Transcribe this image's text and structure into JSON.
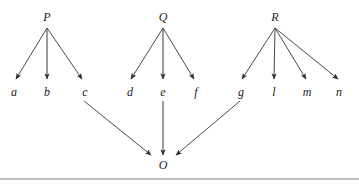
{
  "diagram": {
    "type": "directed-graph",
    "title": "",
    "style": {
      "background": "#ffffff",
      "node_text_color": "#1a1a1a",
      "edge_color": "#4a4a4a",
      "rule_color": "#808080"
    },
    "nodes": [
      {
        "id": "P",
        "label": "P",
        "x": 47,
        "y": 21,
        "role": "parent",
        "group": 1
      },
      {
        "id": "Q",
        "label": "Q",
        "x": 163,
        "y": 21,
        "role": "parent",
        "group": 2
      },
      {
        "id": "R",
        "label": "R",
        "x": 275,
        "y": 21,
        "role": "parent",
        "group": 3
      },
      {
        "id": "a",
        "label": "a",
        "x": 14,
        "y": 96,
        "role": "child",
        "group": 1
      },
      {
        "id": "b",
        "label": "b",
        "x": 47,
        "y": 96,
        "role": "child",
        "group": 1
      },
      {
        "id": "c",
        "label": "c",
        "x": 85,
        "y": 96,
        "role": "child",
        "group": 1
      },
      {
        "id": "d",
        "label": "d",
        "x": 130,
        "y": 96,
        "role": "child",
        "group": 2
      },
      {
        "id": "e",
        "label": "e",
        "x": 163,
        "y": 96,
        "role": "child",
        "group": 2
      },
      {
        "id": "f",
        "label": "f",
        "x": 196,
        "y": 96,
        "role": "child",
        "group": 2
      },
      {
        "id": "g",
        "label": "g",
        "x": 241,
        "y": 96,
        "role": "child",
        "group": 3
      },
      {
        "id": "l",
        "label": "l",
        "x": 274,
        "y": 96,
        "role": "child",
        "group": 3
      },
      {
        "id": "m",
        "label": "m",
        "x": 307,
        "y": 96,
        "role": "child",
        "group": 3
      },
      {
        "id": "n",
        "label": "n",
        "x": 339,
        "y": 96,
        "role": "child",
        "group": 3
      },
      {
        "id": "O",
        "label": "O",
        "x": 163,
        "y": 169,
        "role": "sink",
        "group": 0
      }
    ],
    "edges": [
      {
        "from": "P",
        "to": "a",
        "x1": 47,
        "y1": 28,
        "x2": 16,
        "y2": 79
      },
      {
        "from": "P",
        "to": "b",
        "x1": 47,
        "y1": 28,
        "x2": 47,
        "y2": 79
      },
      {
        "from": "P",
        "to": "c",
        "x1": 47,
        "y1": 28,
        "x2": 82,
        "y2": 79
      },
      {
        "from": "Q",
        "to": "d",
        "x1": 163,
        "y1": 28,
        "x2": 131,
        "y2": 79
      },
      {
        "from": "Q",
        "to": "e",
        "x1": 163,
        "y1": 28,
        "x2": 163,
        "y2": 79
      },
      {
        "from": "Q",
        "to": "f",
        "x1": 163,
        "y1": 28,
        "x2": 194,
        "y2": 79
      },
      {
        "from": "R",
        "to": "g",
        "x1": 275,
        "y1": 28,
        "x2": 242,
        "y2": 79
      },
      {
        "from": "R",
        "to": "l",
        "x1": 275,
        "y1": 28,
        "x2": 274,
        "y2": 79
      },
      {
        "from": "R",
        "to": "m",
        "x1": 275,
        "y1": 28,
        "x2": 306,
        "y2": 79
      },
      {
        "from": "R",
        "to": "n",
        "x1": 275,
        "y1": 28,
        "x2": 338,
        "y2": 79
      },
      {
        "from": "c",
        "to": "O",
        "x1": 84,
        "y1": 101,
        "x2": 151,
        "y2": 155
      },
      {
        "from": "e",
        "to": "O",
        "x1": 163,
        "y1": 101,
        "x2": 163,
        "y2": 155
      },
      {
        "from": "g",
        "to": "O",
        "x1": 240,
        "y1": 101,
        "x2": 176,
        "y2": 155
      }
    ],
    "rule": {
      "x1": 0,
      "x2": 359,
      "y": 179
    }
  }
}
